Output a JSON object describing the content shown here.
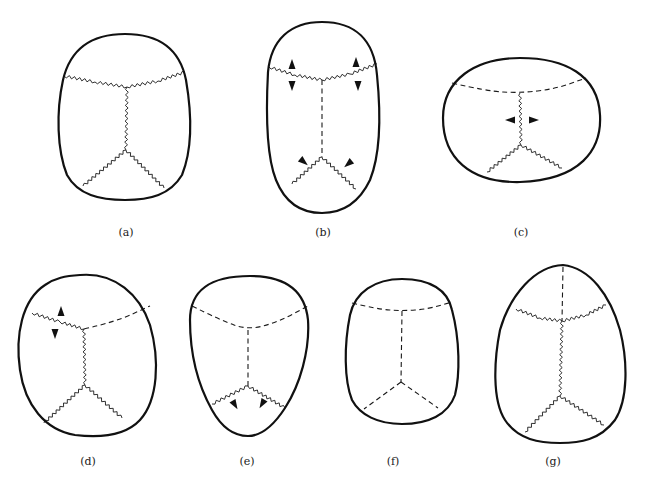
{
  "figure": {
    "legend": {
      "zigzag": "open suture",
      "dashed": "fused suture",
      "arrowhead": "growth direction"
    },
    "panels": [
      {
        "id": "a",
        "label": "(a)",
        "label_pos": [
          126,
          236
        ],
        "outline": "M 125 34 C 160 34 180 50 186 80 C 192 115 192 150 182 175 C 170 195 150 200 125 200 C 100 200 78 195 67 175 C 57 150 56 112 63 80 C 70 50 90 34 125 34 Z",
        "sutures": [
          {
            "name": "coronal",
            "style": "zigzag",
            "points": [
              [
                64,
                76
              ],
              [
                95,
                82
              ],
              [
                127,
                87
              ],
              [
                158,
                81
              ],
              [
                185,
                72
              ]
            ]
          },
          {
            "name": "sagittal",
            "style": "zigzag",
            "points": [
              [
                127,
                87
              ],
              [
                126,
                150
              ]
            ]
          },
          {
            "name": "lambdoid-left",
            "style": "zigzag",
            "points": [
              [
                126,
                150
              ],
              [
                83,
                186
              ]
            ]
          },
          {
            "name": "lambdoid-right",
            "style": "zigzag",
            "points": [
              [
                126,
                150
              ],
              [
                164,
                188
              ]
            ]
          }
        ],
        "arrows": []
      },
      {
        "id": "b",
        "label": "(b)",
        "label_pos": [
          323,
          236
        ],
        "outline": "M 322 22 C 355 22 374 40 377 75 C 381 115 380 155 370 180 C 358 205 340 213 322 213 C 304 213 286 205 276 180 C 266 155 266 110 268 72 C 271 40 290 22 322 22 Z",
        "sutures": [
          {
            "name": "coronal",
            "style": "zigzag",
            "points": [
              [
                269,
                67
              ],
              [
                295,
                75
              ],
              [
                322,
                80
              ],
              [
                350,
                74
              ],
              [
                377,
                64
              ]
            ]
          },
          {
            "name": "sagittal",
            "style": "dashed",
            "points": [
              [
                322,
                80
              ],
              [
                322,
                157
              ]
            ]
          },
          {
            "name": "lambdoid-left",
            "style": "zigzag",
            "points": [
              [
                322,
                157
              ],
              [
                292,
                184
              ]
            ]
          },
          {
            "name": "lambdoid-right",
            "style": "zigzag",
            "points": [
              [
                322,
                157
              ],
              [
                356,
                189
              ]
            ]
          }
        ],
        "arrows": [
          {
            "x": 292,
            "y": 64,
            "dir": "up"
          },
          {
            "x": 292,
            "y": 86,
            "dir": "down"
          },
          {
            "x": 356,
            "y": 62,
            "dir": "up"
          },
          {
            "x": 358,
            "y": 86,
            "dir": "down"
          },
          {
            "x": 304,
            "y": 162,
            "dir": "downleft-in"
          },
          {
            "x": 348,
            "y": 164,
            "dir": "downright-in"
          }
        ]
      },
      {
        "id": "c",
        "label": "(c)",
        "label_pos": [
          521,
          236
        ],
        "outline": "M 520 58 C 565 58 598 75 600 115 C 602 150 580 180 520 182 C 470 183 443 158 443 118 C 443 80 475 58 520 58 Z",
        "sutures": [
          {
            "name": "coronal",
            "style": "dashed",
            "points": [
              [
                452,
                83
              ],
              [
                486,
                91
              ],
              [
                520,
                93
              ],
              [
                555,
                89
              ],
              [
                586,
                78
              ]
            ]
          },
          {
            "name": "sagittal",
            "style": "zigzag",
            "points": [
              [
                520,
                93
              ],
              [
                521,
                145
              ]
            ]
          },
          {
            "name": "lambdoid-left",
            "style": "zigzag",
            "points": [
              [
                521,
                145
              ],
              [
                487,
                172
              ]
            ]
          },
          {
            "name": "lambdoid-right",
            "style": "zigzag",
            "points": [
              [
                521,
                145
              ],
              [
                562,
                168
              ]
            ]
          }
        ],
        "arrows": [
          {
            "x": 510,
            "y": 120,
            "dir": "left"
          },
          {
            "x": 534,
            "y": 120,
            "dir": "right"
          }
        ]
      },
      {
        "id": "d",
        "label": "(d)",
        "label_pos": [
          88,
          465
        ],
        "outline": "M 80 275 C 115 272 140 295 150 325 C 160 360 158 400 140 420 C 125 436 100 438 75 435 C 45 430 25 405 20 370 C 15 335 22 300 45 285 C 55 278 65 276 80 275 Z",
        "sutures": [
          {
            "name": "coronal-left",
            "style": "zigzag",
            "points": [
              [
                32,
                313
              ],
              [
                60,
                322
              ],
              [
                84,
                329
              ]
            ]
          },
          {
            "name": "coronal-right",
            "style": "dashed",
            "points": [
              [
                84,
                329
              ],
              [
                115,
                322
              ],
              [
                150,
                306
              ]
            ]
          },
          {
            "name": "sagittal",
            "style": "zigzag",
            "points": [
              [
                84,
                329
              ],
              [
                85,
                385
              ]
            ]
          },
          {
            "name": "lambdoid-left",
            "style": "zigzag",
            "points": [
              [
                85,
                385
              ],
              [
                44,
                423
              ]
            ]
          },
          {
            "name": "lambdoid-right",
            "style": "zigzag",
            "points": [
              [
                85,
                385
              ],
              [
                122,
                418
              ]
            ]
          }
        ],
        "arrows": [
          {
            "x": 61,
            "y": 311,
            "dir": "up"
          },
          {
            "x": 55,
            "y": 334,
            "dir": "down"
          }
        ]
      },
      {
        "id": "e",
        "label": "(e)",
        "label_pos": [
          247,
          465
        ],
        "outline": "M 250 276 C 285 276 305 290 308 320 C 310 350 300 385 285 408 C 272 428 260 436 248 436 C 235 436 222 428 212 410 C 198 385 190 355 190 320 C 190 290 210 276 250 276 Z",
        "sutures": [
          {
            "name": "coronal",
            "style": "dashed",
            "points": [
              [
                192,
                306
              ],
              [
                220,
                320
              ],
              [
                248,
                330
              ],
              [
                278,
                322
              ],
              [
                308,
                306
              ]
            ]
          },
          {
            "name": "sagittal",
            "style": "dashed",
            "points": [
              [
                248,
                330
              ],
              [
                248,
                386
              ]
            ]
          },
          {
            "name": "lambdoid-left",
            "style": "zigzag",
            "points": [
              [
                248,
                386
              ],
              [
                212,
                404
              ]
            ]
          },
          {
            "name": "lambdoid-right",
            "style": "zigzag",
            "points": [
              [
                248,
                386
              ],
              [
                285,
                408
              ]
            ]
          }
        ],
        "arrows": [
          {
            "x": 235,
            "y": 405,
            "dir": "down-in-left"
          },
          {
            "x": 262,
            "y": 404,
            "dir": "down-in-right"
          }
        ]
      },
      {
        "id": "f",
        "label": "(f)",
        "label_pos": [
          393,
          465
        ],
        "outline": "M 402 279 C 430 279 448 290 452 310 C 460 340 460 375 455 395 C 448 415 428 424 402 424 C 378 424 360 415 352 400 C 344 380 344 345 350 315 C 355 292 375 279 402 279 Z",
        "sutures": [
          {
            "name": "coronal",
            "style": "dashed",
            "points": [
              [
                352,
                303
              ],
              [
                377,
                309
              ],
              [
                402,
                311
              ],
              [
                428,
                309
              ],
              [
                452,
                302
              ]
            ]
          },
          {
            "name": "sagittal",
            "style": "dashed",
            "points": [
              [
                402,
                311
              ],
              [
                401,
                382
              ]
            ]
          },
          {
            "name": "lambdoid-left",
            "style": "dashed",
            "points": [
              [
                401,
                382
              ],
              [
                364,
                409
              ]
            ]
          },
          {
            "name": "lambdoid-right",
            "style": "dashed",
            "points": [
              [
                401,
                382
              ],
              [
                438,
                408
              ]
            ]
          }
        ],
        "arrows": []
      },
      {
        "id": "g",
        "label": "(g)",
        "label_pos": [
          553,
          465
        ],
        "outline": "M 563 265 C 590 268 610 295 620 330 C 628 362 628 400 615 420 C 600 440 580 443 560 443 C 540 443 518 440 505 420 C 492 400 494 360 500 330 C 510 295 535 266 563 265 Z",
        "sutures": [
          {
            "name": "metopic",
            "style": "dashed",
            "points": [
              [
                563,
                267
              ],
              [
                562,
                321
              ]
            ]
          },
          {
            "name": "coronal",
            "style": "zigzag",
            "points": [
              [
                516,
                309
              ],
              [
                540,
                318
              ],
              [
                562,
                321
              ],
              [
                586,
                315
              ],
              [
                606,
                305
              ]
            ]
          },
          {
            "name": "sagittal",
            "style": "zigzag",
            "points": [
              [
                562,
                321
              ],
              [
                560,
                396
              ]
            ]
          },
          {
            "name": "lambdoid-left",
            "style": "zigzag",
            "points": [
              [
                560,
                396
              ],
              [
                525,
                432
              ]
            ]
          },
          {
            "name": "lambdoid-right",
            "style": "zigzag",
            "points": [
              [
                560,
                396
              ],
              [
                604,
                425
              ]
            ]
          }
        ],
        "arrows": []
      }
    ]
  }
}
